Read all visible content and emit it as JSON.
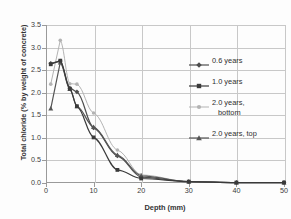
{
  "chart_data": {
    "type": "line",
    "title": "",
    "xlabel": "Depth (mm)",
    "ylabel": "Total chloride (% by weight of concrete)",
    "xlim": [
      0,
      50
    ],
    "ylim": [
      0,
      3.5
    ],
    "xticks": [
      0,
      10,
      20,
      30,
      40,
      50
    ],
    "yticks": [
      "0.0",
      "0.5",
      "1.0",
      "1.5",
      "2.0",
      "2.5",
      "3.0",
      "3.5"
    ],
    "grid": true,
    "legend_position": "right",
    "series": [
      {
        "name": "0.6 years",
        "marker": "diamond",
        "color": "#4d4d4d",
        "x": [
          1,
          3,
          5,
          6.5,
          10,
          15,
          20,
          30,
          40,
          50
        ],
        "y": [
          2.65,
          2.7,
          2.1,
          2.02,
          1.22,
          0.6,
          0.13,
          0.03,
          0.01,
          0.01
        ]
      },
      {
        "name": "1.0 years",
        "marker": "square",
        "color": "#3a3a3a",
        "x": [
          1,
          3,
          5,
          6.5,
          10,
          15,
          20,
          30,
          40,
          50
        ],
        "y": [
          2.63,
          2.71,
          2.09,
          1.7,
          1.01,
          0.29,
          0.1,
          0.03,
          0.01,
          0.01
        ]
      },
      {
        "name": "2.0 years, bottom",
        "marker": "circle",
        "color": "#b3b3b3",
        "x": [
          1,
          3,
          5,
          6.5,
          10,
          15,
          20,
          30,
          40,
          50
        ],
        "y": [
          2.19,
          3.16,
          2.2,
          2.19,
          1.55,
          0.73,
          0.18,
          0.03,
          0.01,
          0.01
        ]
      },
      {
        "name": "2.0 years, top",
        "marker": "triangle",
        "color": "#555555",
        "x": [
          1,
          3,
          5,
          6.5,
          10,
          15,
          20,
          30,
          40,
          50
        ],
        "y": [
          1.65,
          2.67,
          2.08,
          1.7,
          1.24,
          0.62,
          0.16,
          0.03,
          0.01,
          0.01
        ]
      }
    ]
  },
  "legend": {
    "items": [
      {
        "label": "0.6 years",
        "label2": ""
      },
      {
        "label": "1.0 years",
        "label2": ""
      },
      {
        "label": "2.0 years,",
        "label2": "bottom"
      },
      {
        "label": "2.0 years, top",
        "label2": ""
      }
    ]
  },
  "axes": {
    "x_title": "Depth (mm)",
    "y_title": "Total chloride (% by weight of concrete)",
    "x_ticks": [
      "0",
      "10",
      "20",
      "30",
      "40",
      "50"
    ],
    "y_ticks": [
      "0.0",
      "0.5",
      "1.0",
      "1.5",
      "2.0",
      "2.5",
      "3.0",
      "3.5"
    ]
  },
  "colors": {
    "grid": "#c8c8c8",
    "axis": "#9a9a9a",
    "series_0": "#4d4d4d",
    "series_1": "#3a3a3a",
    "series_2": "#b3b3b3",
    "series_3": "#555555",
    "text": "#333333"
  }
}
